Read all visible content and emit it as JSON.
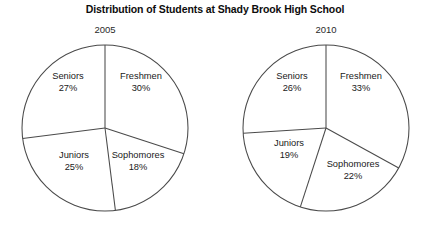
{
  "chart_data": {
    "type": "pie",
    "title": "Distribution of Students at Shady Brook High School",
    "xlabel": "",
    "ylabel": "",
    "legend": "none",
    "grid": false,
    "charts": [
      {
        "label": "2005",
        "categories": [
          "Freshmen",
          "Sophomores",
          "Juniors",
          "Seniors"
        ],
        "values": [
          30,
          18,
          25,
          27
        ],
        "value_labels": [
          "30%",
          "18%",
          "25%",
          "27%"
        ],
        "start_angle_deg": 0,
        "direction": "clockwise",
        "center": [
          105,
          128
        ],
        "radius": 83
      },
      {
        "label": "2010",
        "categories": [
          "Freshmen",
          "Sophomores",
          "Juniors",
          "Seniors"
        ],
        "values": [
          33,
          22,
          19,
          26
        ],
        "value_labels": [
          "33%",
          "22%",
          "19%",
          "26%"
        ],
        "start_angle_deg": 0,
        "direction": "clockwise",
        "center": [
          326,
          128
        ],
        "radius": 83
      }
    ]
  },
  "colors": {
    "background": "#ffffff",
    "outline": "#4a4a4a",
    "text": "#1a1a1a",
    "title": "#0d0d0d"
  },
  "labels": {
    "pie2005": {
      "freshmen_name": "Freshmen",
      "freshmen_pct": "30%",
      "sophomores_name": "Sophomores",
      "sophomores_pct": "18%",
      "juniors_name": "Juniors",
      "juniors_pct": "25%",
      "seniors_name": "Seniors",
      "seniors_pct": "27%"
    },
    "pie2010": {
      "freshmen_name": "Freshmen",
      "freshmen_pct": "33%",
      "sophomores_name": "Sophomores",
      "sophomores_pct": "22%",
      "juniors_name": "Juniors",
      "juniors_pct": "19%",
      "seniors_name": "Seniors",
      "seniors_pct": "26%"
    }
  }
}
